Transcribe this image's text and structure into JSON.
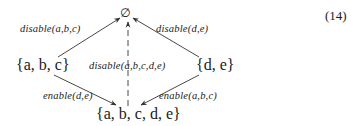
{
  "equation_number": "(14)",
  "nodes": {
    "top": {
      "label": "∅"
    },
    "left": {
      "label": "{a, b, c}"
    },
    "right": {
      "label": "{d, e}"
    },
    "bottom": {
      "label": "{a, b, c, d, e}"
    }
  },
  "edges": [
    {
      "from": "left",
      "to": "top",
      "label": "disable(a,b,c)",
      "style": "solid"
    },
    {
      "from": "right",
      "to": "top",
      "label": "disable(d,e)",
      "style": "solid"
    },
    {
      "from": "bottom",
      "to": "top",
      "label": "disable(a,b,c,d,e)",
      "style": "dashed"
    },
    {
      "from": "left",
      "to": "bottom",
      "label": "enable(d,e)",
      "style": "solid"
    },
    {
      "from": "right",
      "to": "bottom",
      "label": "enable(a,b,c)",
      "style": "solid"
    }
  ],
  "colors": {
    "line": "#333333",
    "text": "#1a1a1a",
    "background": "#ffffff"
  }
}
